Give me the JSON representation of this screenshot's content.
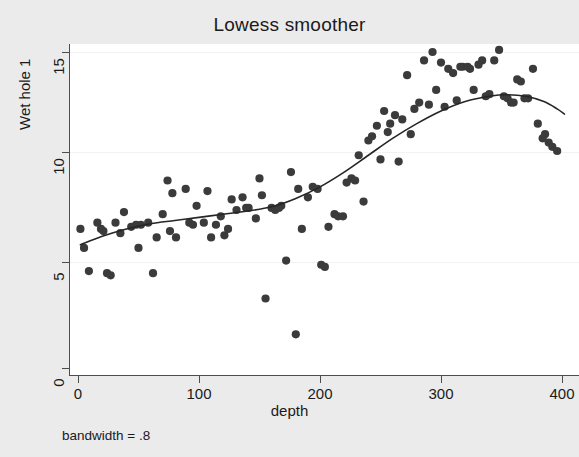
{
  "chart_data": {
    "type": "scatter",
    "title": "Lowess smoother",
    "xlabel": "depth",
    "ylabel": "Wet hole 1",
    "note": "bandwidth = .8",
    "grid": true,
    "legend": "none",
    "xlim": [
      -8,
      414
    ],
    "ylim": [
      -0.6,
      15.8
    ],
    "xticks": [
      0,
      100,
      200,
      300,
      400
    ],
    "yticks": [
      0,
      5,
      10,
      15
    ],
    "xtick_labels": [
      "0",
      "100",
      "200",
      "300",
      "400"
    ],
    "ytick_labels": [
      "0",
      "5",
      "10",
      "15"
    ],
    "colors": {
      "background": "#ebebeb",
      "plot_background": "#ffffff",
      "marker": "#3b3b3b",
      "smoother_line": "#262626",
      "axis": "#4d4d4d",
      "gridline": "#f2f2f2",
      "text": "#1a1a1a"
    },
    "series": [
      {
        "name": "Wet hole 1",
        "marker": "circle",
        "points": [
          [
            2,
            6.6
          ],
          [
            5,
            5.7
          ],
          [
            9,
            4.6
          ],
          [
            16,
            6.9
          ],
          [
            19,
            6.6
          ],
          [
            21,
            6.5
          ],
          [
            24,
            4.5
          ],
          [
            27,
            4.4
          ],
          [
            31,
            6.9
          ],
          [
            35,
            6.4
          ],
          [
            38,
            7.4
          ],
          [
            44,
            6.7
          ],
          [
            48,
            6.8
          ],
          [
            50,
            5.7
          ],
          [
            52,
            6.8
          ],
          [
            58,
            6.9
          ],
          [
            62,
            4.5
          ],
          [
            65,
            6.2
          ],
          [
            70,
            7.3
          ],
          [
            74,
            8.9
          ],
          [
            76,
            6.5
          ],
          [
            78,
            8.3
          ],
          [
            81,
            6.2
          ],
          [
            89,
            8.5
          ],
          [
            92,
            6.9
          ],
          [
            95,
            6.8
          ],
          [
            98,
            7.7
          ],
          [
            104,
            6.9
          ],
          [
            107,
            8.4
          ],
          [
            110,
            6.2
          ],
          [
            114,
            6.8
          ],
          [
            118,
            7.2
          ],
          [
            121,
            6.3
          ],
          [
            124,
            6.6
          ],
          [
            127,
            8.0
          ],
          [
            131,
            7.5
          ],
          [
            136,
            8.1
          ],
          [
            139,
            7.6
          ],
          [
            141,
            7.6
          ],
          [
            147,
            7.1
          ],
          [
            150,
            9.0
          ],
          [
            152,
            8.2
          ],
          [
            155,
            3.3
          ],
          [
            160,
            7.6
          ],
          [
            163,
            7.5
          ],
          [
            166,
            7.6
          ],
          [
            168,
            7.7
          ],
          [
            172,
            5.1
          ],
          [
            176,
            9.3
          ],
          [
            180,
            1.6
          ],
          [
            182,
            8.5
          ],
          [
            185,
            6.6
          ],
          [
            190,
            8.1
          ],
          [
            194,
            8.6
          ],
          [
            198,
            8.5
          ],
          [
            201,
            4.9
          ],
          [
            204,
            4.8
          ],
          [
            207,
            6.7
          ],
          [
            212,
            7.3
          ],
          [
            215,
            7.2
          ],
          [
            219,
            7.2
          ],
          [
            222,
            8.8
          ],
          [
            226,
            9.0
          ],
          [
            229,
            8.9
          ],
          [
            232,
            10.1
          ],
          [
            236,
            7.9
          ],
          [
            240,
            10.8
          ],
          [
            243,
            11.0
          ],
          [
            247,
            11.5
          ],
          [
            250,
            9.9
          ],
          [
            253,
            12.2
          ],
          [
            256,
            11.2
          ],
          [
            258,
            11.6
          ],
          [
            262,
            12.0
          ],
          [
            265,
            9.8
          ],
          [
            268,
            11.8
          ],
          [
            272,
            13.9
          ],
          [
            275,
            11.1
          ],
          [
            278,
            12.3
          ],
          [
            282,
            12.6
          ],
          [
            286,
            14.6
          ],
          [
            290,
            12.5
          ],
          [
            293,
            15.0
          ],
          [
            296,
            13.2
          ],
          [
            300,
            14.5
          ],
          [
            303,
            12.4
          ],
          [
            306,
            14.2
          ],
          [
            310,
            14.0
          ],
          [
            313,
            12.7
          ],
          [
            316,
            14.3
          ],
          [
            318,
            14.3
          ],
          [
            322,
            14.3
          ],
          [
            324,
            14.2
          ],
          [
            327,
            13.2
          ],
          [
            331,
            14.4
          ],
          [
            334,
            14.6
          ],
          [
            337,
            12.9
          ],
          [
            340,
            13.0
          ],
          [
            344,
            14.6
          ],
          [
            348,
            15.1
          ],
          [
            352,
            12.9
          ],
          [
            355,
            12.8
          ],
          [
            358,
            12.6
          ],
          [
            360,
            12.6
          ],
          [
            363,
            13.7
          ],
          [
            366,
            13.6
          ],
          [
            369,
            12.8
          ],
          [
            372,
            12.8
          ],
          [
            376,
            14.2
          ],
          [
            380,
            11.6
          ],
          [
            384,
            10.9
          ],
          [
            386,
            11.1
          ],
          [
            389,
            10.7
          ],
          [
            392,
            10.5
          ],
          [
            396,
            10.3
          ]
        ]
      }
    ],
    "smoother": {
      "name": "lowess",
      "bandwidth": 0.8,
      "points": [
        [
          2,
          5.85
        ],
        [
          20,
          6.25
        ],
        [
          40,
          6.6
        ],
        [
          60,
          6.85
        ],
        [
          80,
          7.0
        ],
        [
          100,
          7.15
        ],
        [
          120,
          7.3
        ],
        [
          140,
          7.45
        ],
        [
          160,
          7.65
        ],
        [
          180,
          8.05
        ],
        [
          200,
          8.6
        ],
        [
          220,
          9.3
        ],
        [
          240,
          10.1
        ],
        [
          260,
          10.9
        ],
        [
          280,
          11.6
        ],
        [
          300,
          12.2
        ],
        [
          320,
          12.65
        ],
        [
          340,
          12.9
        ],
        [
          355,
          12.97
        ],
        [
          370,
          12.9
        ],
        [
          385,
          12.65
        ],
        [
          396,
          12.3
        ],
        [
          402,
          12.05
        ]
      ]
    }
  }
}
